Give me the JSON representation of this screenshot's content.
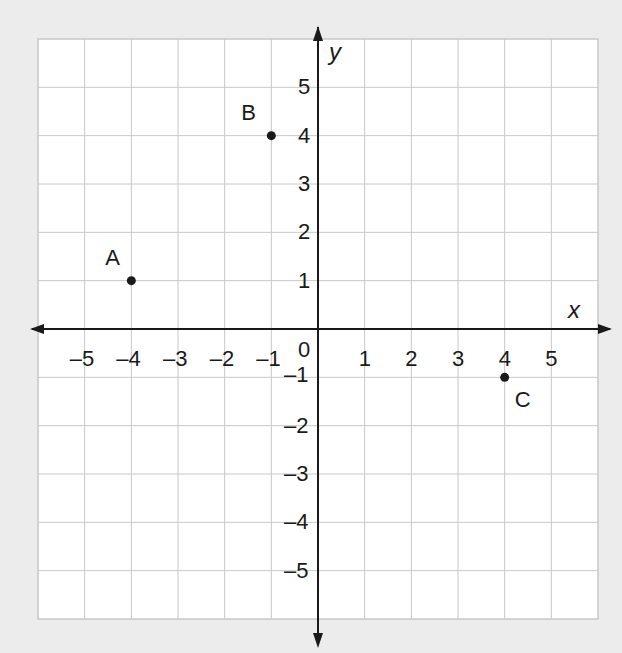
{
  "chart_data": {
    "type": "scatter",
    "title": "",
    "xlabel": "x",
    "ylabel": "y",
    "xlim": [
      -6,
      6
    ],
    "ylim": [
      -6,
      6
    ],
    "grid": true,
    "origin_label": "0",
    "x_ticks": [
      -5,
      -4,
      -3,
      -2,
      -1,
      1,
      2,
      3,
      4,
      5
    ],
    "x_tick_labels": [
      "–5",
      "–4",
      "–3",
      "–2",
      "–1",
      "1",
      "2",
      "3",
      "4",
      "5"
    ],
    "y_ticks": [
      5,
      4,
      3,
      2,
      1,
      -1,
      -2,
      -3,
      -4,
      -5
    ],
    "y_tick_labels": [
      "5",
      "4",
      "3",
      "2",
      "1",
      "–1",
      "–2",
      "–3",
      "–4",
      "–5"
    ],
    "points": [
      {
        "label": "A",
        "x": -4,
        "y": 1
      },
      {
        "label": "B",
        "x": -1,
        "y": 4
      },
      {
        "label": "C",
        "x": 4,
        "y": -1
      }
    ]
  },
  "colors": {
    "background": "#ececec",
    "grid_fill": "#ffffff",
    "grid_line": "#c8c8c8",
    "axis": "#1a1a1a"
  }
}
